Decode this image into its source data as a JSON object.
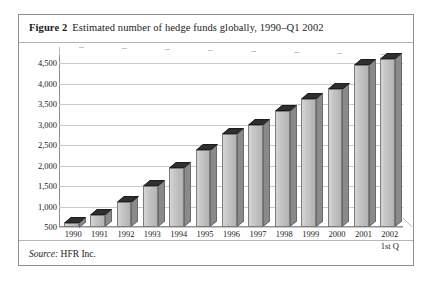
{
  "figure": {
    "label": "Figure 2",
    "caption": "Estimated number of hedge funds globally, 1990–Q1 2002",
    "source_label": "Source:",
    "source_value": "HFR Inc."
  },
  "chart_data": {
    "type": "bar",
    "title": "Estimated number of hedge funds globally, 1990–Q1 2002",
    "xlabel": "",
    "ylabel": "",
    "categories": [
      "1990",
      "1991",
      "1992",
      "1993",
      "1994",
      "1995",
      "1996",
      "1997",
      "1998",
      "1999",
      "2000",
      "2001",
      "2002"
    ],
    "category_sublabels": [
      "",
      "",
      "",
      "",
      "",
      "",
      "",
      "",
      "",
      "",
      "",
      "",
      "1st Q"
    ],
    "values": [
      610,
      800,
      1105,
      1510,
      1945,
      2385,
      2780,
      2990,
      3325,
      3615,
      3870,
      4455,
      4600
    ],
    "ylim": [
      500,
      4700
    ],
    "yticks": [
      500,
      1000,
      1500,
      2000,
      2500,
      3000,
      3500,
      4000,
      4500
    ],
    "ytick_labels": [
      "500",
      "1,000",
      "1,500",
      "2,000",
      "2,500",
      "3,000",
      "3,500",
      "4,000",
      "4,500"
    ],
    "grid": true,
    "legend": "none",
    "series": [
      {
        "name": "Number of hedge funds",
        "values": [
          610,
          800,
          1105,
          1510,
          1945,
          2385,
          2780,
          2990,
          3325,
          3615,
          3870,
          4455,
          4600
        ]
      }
    ],
    "colors": {
      "bar_face": "#c6c6c6",
      "bar_side": "#8a8a8a",
      "bar_top": "#2f2f2f",
      "grid": "#c9c9c9",
      "axis": "#8f8f8f",
      "frame": "#8d8d8d",
      "text": "#1a1a1a"
    }
  }
}
